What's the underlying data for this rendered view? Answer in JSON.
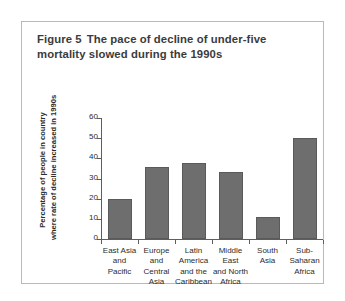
{
  "figure": {
    "number": "Figure 5",
    "title": "The pace of decline of under-five mortality slowed during the 1990s"
  },
  "chart_data": {
    "type": "bar",
    "categories": [
      "East Asia and Pacific",
      "Europe and Central Asia",
      "Latin America and the Caribbean",
      "Middle East and North Africa",
      "South Asia",
      "Sub-Saharan Africa"
    ],
    "category_lines": [
      [
        "East Asia",
        "and",
        "Pacific"
      ],
      [
        "Europe",
        "and",
        "Central",
        "Asia"
      ],
      [
        "Latin",
        "America",
        "and the",
        "Caribbean"
      ],
      [
        "Middle",
        "East",
        "and North",
        "Africa"
      ],
      [
        "South",
        "Asia"
      ],
      [
        "Sub-",
        "Saharan",
        "Africa"
      ]
    ],
    "values": [
      20,
      35.5,
      37.5,
      33,
      11,
      50
    ],
    "xlabel": "",
    "ylabel": "Percentage of people in country where rate of decline increased in 1990s",
    "ylabel_lines": [
      "Percentage of people in country",
      "where rate of decline increased in 1990s"
    ],
    "ylim": [
      0,
      60
    ],
    "yticks": [
      0,
      10,
      20,
      30,
      40,
      50,
      60
    ],
    "ytick_labels": [
      "0",
      "10",
      "20",
      "30",
      "40",
      "50",
      "60"
    ],
    "grid": false,
    "legend": false,
    "bar_color": "#6e6e6e",
    "axis_color": "#5e5e5e",
    "background": "#ffffff"
  }
}
